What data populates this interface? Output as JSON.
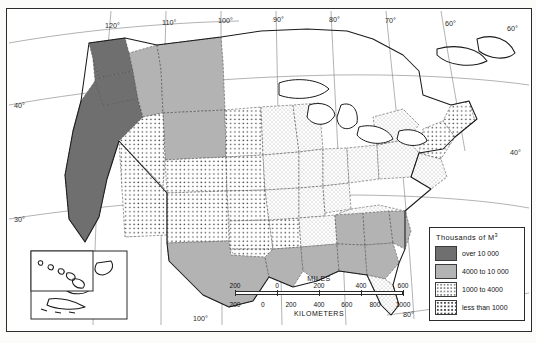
{
  "map": {
    "subject": "United States wood volume thematic map",
    "background_color": "#ffffff",
    "frame_color": "#2b2b2b",
    "graticule_color": "#7d7d7d"
  },
  "legend": {
    "title_main": "Thousands  of  M",
    "title_sup": "3",
    "entries": [
      {
        "label": "over 10 000",
        "swatch": "solid-dark-gray",
        "color": "#6f6f6f"
      },
      {
        "label": "4000 to 10 000",
        "swatch": "solid-mid-gray",
        "color": "#b3b3b3"
      },
      {
        "label": "1000 to 4000",
        "swatch": "fine-stipple",
        "color": "#8a8a8a"
      },
      {
        "label": "less than 1000",
        "swatch": "coarse-dot-grid",
        "color": "#4a4a4a"
      }
    ]
  },
  "scale_bar": {
    "miles_caption": "MILES",
    "kilometers_caption": "KILOMETERS",
    "miles_ticks": [
      "200",
      "0",
      "200",
      "400",
      "600"
    ],
    "kilometers_ticks": [
      "200",
      "0",
      "200",
      "400",
      "600",
      "800",
      "1000"
    ]
  },
  "graticule_labels": {
    "top": [
      "120°",
      "110°",
      "100°",
      "90°",
      "80°",
      "70°",
      "60°"
    ],
    "left": [
      "40°",
      "30°"
    ],
    "right": [
      "60°",
      "40°"
    ],
    "bottom": [
      "100°",
      "80°"
    ]
  },
  "classified_areas": [
    {
      "name": "Washington",
      "class": "over 10 000"
    },
    {
      "name": "Oregon",
      "class": "over 10 000"
    },
    {
      "name": "California",
      "class": "over 10 000"
    },
    {
      "name": "Idaho",
      "class": "4000 to 10 000"
    },
    {
      "name": "Montana",
      "class": "4000 to 10 000"
    },
    {
      "name": "Wyoming",
      "class": "4000 to 10 000"
    },
    {
      "name": "Nevada",
      "class": "less than 1000"
    },
    {
      "name": "Utah",
      "class": "less than 1000"
    },
    {
      "name": "Colorado",
      "class": "less than 1000"
    },
    {
      "name": "Arizona",
      "class": "less than 1000"
    },
    {
      "name": "New Mexico",
      "class": "less than 1000"
    },
    {
      "name": "North Dakota",
      "class": "less than 1000"
    },
    {
      "name": "South Dakota",
      "class": "less than 1000"
    },
    {
      "name": "Nebraska",
      "class": "less than 1000"
    },
    {
      "name": "Kansas",
      "class": "less than 1000"
    },
    {
      "name": "Oklahoma",
      "class": "less than 1000"
    },
    {
      "name": "Iowa",
      "class": "less than 1000"
    },
    {
      "name": "Minnesota",
      "class": "1000 to 4000"
    },
    {
      "name": "Wisconsin",
      "class": "1000 to 4000"
    },
    {
      "name": "Michigan",
      "class": "1000 to 4000"
    },
    {
      "name": "Illinois",
      "class": "1000 to 4000"
    },
    {
      "name": "Indiana",
      "class": "1000 to 4000"
    },
    {
      "name": "Ohio",
      "class": "1000 to 4000"
    },
    {
      "name": "Missouri",
      "class": "1000 to 4000"
    },
    {
      "name": "Kentucky",
      "class": "1000 to 4000"
    },
    {
      "name": "Tennessee",
      "class": "1000 to 4000"
    },
    {
      "name": "West Virginia",
      "class": "1000 to 4000"
    },
    {
      "name": "Virginia",
      "class": "1000 to 4000"
    },
    {
      "name": "Pennsylvania",
      "class": "1000 to 4000"
    },
    {
      "name": "New York",
      "class": "1000 to 4000"
    },
    {
      "name": "Maine",
      "class": "less than 1000"
    },
    {
      "name": "New Hampshire",
      "class": "less than 1000"
    },
    {
      "name": "Vermont",
      "class": "less than 1000"
    },
    {
      "name": "Texas",
      "class": "4000 to 10 000"
    },
    {
      "name": "Louisiana",
      "class": "4000 to 10 000"
    },
    {
      "name": "Arkansas",
      "class": "4000 to 10 000"
    },
    {
      "name": "Mississippi",
      "class": "4000 to 10 000"
    },
    {
      "name": "Alabama",
      "class": "4000 to 10 000"
    },
    {
      "name": "Georgia",
      "class": "4000 to 10 000"
    },
    {
      "name": "South Carolina",
      "class": "4000 to 10 000"
    },
    {
      "name": "North Carolina",
      "class": "4000 to 10 000"
    },
    {
      "name": "Florida",
      "class": "1000 to 4000"
    }
  ],
  "insets": [
    {
      "name": "Alaska"
    },
    {
      "name": "Hawaii"
    }
  ]
}
